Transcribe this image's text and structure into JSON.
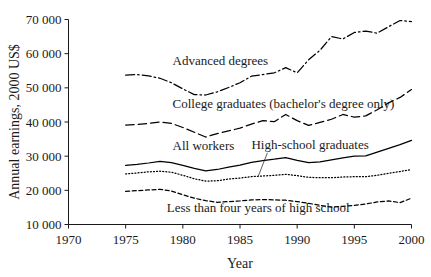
{
  "chart_data": {
    "type": "line",
    "title": "",
    "xlabel": "Year",
    "ylabel": "Annual earnings, 2000 US$",
    "xlim": [
      1970,
      2000
    ],
    "ylim": [
      10000,
      70000
    ],
    "xticks": [
      1970,
      1975,
      1980,
      1985,
      1990,
      1995,
      2000
    ],
    "xticklabels": [
      "1970",
      "1975",
      "1980",
      "1985",
      "1990",
      "1995",
      "2000"
    ],
    "yticks": [
      10000,
      20000,
      30000,
      40000,
      50000,
      60000,
      70000
    ],
    "yticklabels": [
      "10 000",
      "20 000",
      "30 000",
      "40 000",
      "50 000",
      "60 000",
      "70 000"
    ],
    "grid": false,
    "legend_position": "inline-labels",
    "x": [
      1975,
      1976,
      1977,
      1978,
      1979,
      1980,
      1981,
      1982,
      1983,
      1984,
      1985,
      1986,
      1987,
      1988,
      1989,
      1990,
      1991,
      1992,
      1993,
      1994,
      1995,
      1996,
      1997,
      1998,
      1999,
      2000
    ],
    "series": [
      {
        "name": "Advanced degrees",
        "style": "dash-dot",
        "values": [
          53700,
          53900,
          53500,
          52800,
          51500,
          49700,
          48000,
          47900,
          48800,
          50100,
          51500,
          53400,
          53900,
          54400,
          55900,
          54400,
          58200,
          61000,
          65000,
          64300,
          66200,
          66600,
          66000,
          67900,
          69700,
          69400
        ]
      },
      {
        "name": "College graduates (bachelor's degree only)",
        "style": "long-dash",
        "values": [
          39100,
          39300,
          39600,
          40000,
          39600,
          38400,
          37000,
          35600,
          36600,
          37400,
          38200,
          39400,
          40400,
          40100,
          42200,
          40400,
          39000,
          39900,
          40800,
          42200,
          41400,
          41800,
          43600,
          45600,
          47200,
          49500
        ]
      },
      {
        "name": "All workers",
        "style": "solid",
        "values": [
          27300,
          27600,
          28000,
          28500,
          28100,
          27300,
          26400,
          25700,
          26100,
          26800,
          27400,
          28200,
          28700,
          29100,
          29600,
          28800,
          28100,
          28300,
          28900,
          29500,
          30000,
          30100,
          31200,
          32300,
          33400,
          34600
        ]
      },
      {
        "name": "High-school graduates",
        "style": "dotted",
        "values": [
          24800,
          25100,
          25400,
          25600,
          25300,
          24400,
          23400,
          22700,
          22800,
          23300,
          23600,
          24000,
          24200,
          24400,
          24700,
          24300,
          23800,
          23700,
          23700,
          23900,
          24000,
          24000,
          24400,
          25000,
          25500,
          26100
        ]
      },
      {
        "name": "Less than four years of high school",
        "style": "short-dash",
        "values": [
          19700,
          19900,
          20100,
          20300,
          19800,
          18700,
          17700,
          17000,
          16500,
          16700,
          16900,
          17200,
          17300,
          17200,
          17100,
          16700,
          16200,
          15600,
          15100,
          15300,
          15600,
          16000,
          16600,
          16900,
          16400,
          17700
        ]
      }
    ],
    "annotations": [
      {
        "text": "Advanced degrees",
        "x": 1979.1,
        "y": 56600
      },
      {
        "text": "College graduates (bachelor's degree only)",
        "x": 1979.1,
        "y": 44200
      },
      {
        "text": "All workers",
        "x": 1979.1,
        "y": 31900
      },
      {
        "text": "High-school graduates",
        "x": 1986.0,
        "y": 32100
      },
      {
        "text": "Less than four years of high school",
        "x": 1978.6,
        "y": 13600
      }
    ],
    "leader_line": {
      "from_x": 1987.4,
      "from_y": 31000,
      "to_x": 1986.6,
      "to_y": 24150
    }
  }
}
